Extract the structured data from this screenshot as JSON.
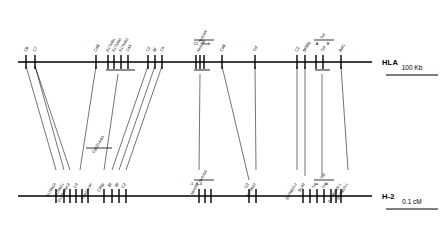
{
  "figure": {
    "type": "comparative-genetic-map"
  },
  "axes": [
    {
      "id": "hla",
      "label": "HLA",
      "y": 62,
      "x_start": 18,
      "x_end": 372,
      "species": "human"
    },
    {
      "id": "h2",
      "label": "H-2",
      "y": 196,
      "x_start": 18,
      "x_end": 372,
      "species": "mouse"
    }
  ],
  "scalebars": [
    {
      "id": "kb",
      "label": "100 Kb",
      "x1": 386,
      "x2": 438,
      "y": 75,
      "text_y": 70
    },
    {
      "id": "cm",
      "label": "0.1 cM",
      "x1": 386,
      "x2": 438,
      "y": 209,
      "text_y": 204
    }
  ],
  "hla_loci": [
    {
      "label": "C6",
      "x": 26
    },
    {
      "label": "C7",
      "x": 35
    },
    {
      "label": "C4B",
      "x": 96
    },
    {
      "label": "D17S451",
      "x": 108
    },
    {
      "label": "D17S450",
      "x": 114
    },
    {
      "label": "D17S452",
      "x": 121
    },
    {
      "label": "C4A",
      "x": 128
    },
    {
      "label": "C2",
      "x": 148
    },
    {
      "label": "Bf",
      "x": 155
    },
    {
      "label": "C4",
      "x": 162
    },
    {
      "label": "Notch4",
      "x": 199
    },
    {
      "label": "C4B",
      "x": 222
    },
    {
      "label": "Tnf",
      "x": 255
    },
    {
      "label": "C2",
      "x": 297
    },
    {
      "label": "Bf/Bfg",
      "x": 305
    },
    {
      "label": "Tnf",
      "x": 323
    },
    {
      "label": "Bat1",
      "x": 341
    }
  ],
  "hla_tick_x": [
    26,
    35,
    96,
    108,
    114,
    121,
    128,
    148,
    155,
    162,
    196,
    200,
    204,
    222,
    255,
    297,
    305,
    316,
    323,
    341
  ],
  "h2_tick_x": [
    56,
    64,
    70,
    76,
    82,
    88,
    104,
    112,
    119,
    126,
    199,
    205,
    211,
    249,
    256,
    303,
    310,
    317,
    324,
    331,
    336,
    341
  ],
  "hla_brackets": [
    {
      "id": "c4-cluster",
      "x1": 106,
      "x2": 135,
      "y": 70,
      "labels": []
    },
    {
      "id": "notch-cluster",
      "x1": 194,
      "x2": 210,
      "y": 70,
      "labels": []
    },
    {
      "id": "tnf-cluster",
      "x1": 315,
      "x2": 330,
      "y": 70,
      "labels": []
    }
  ],
  "hla_top_brackets": [
    {
      "id": "notch4-bracket",
      "x1": 194,
      "x2": 214,
      "y": 40,
      "top_label": "Notch4",
      "sub_labels": [
        {
          "text": "21",
          "x": 196
        },
        {
          "text": "Rxrb",
          "x": 206
        }
      ]
    },
    {
      "id": "tnf-bracket",
      "x1": 314,
      "x2": 334,
      "y": 40,
      "top_label": "Tnf",
      "sub_labels": [
        {
          "text": "A",
          "x": 317
        },
        {
          "text": "B",
          "x": 328
        }
      ]
    }
  ],
  "h2_brackets": [
    {
      "id": "cyp21-bracket",
      "x1": 86,
      "x2": 112,
      "y": 148,
      "top_label": "Cyp21a-ps",
      "sub_labels": []
    },
    {
      "id": "notch-bracket",
      "x1": 194,
      "x2": 214,
      "y": 180,
      "top_label": "Notch4",
      "sub_labels": [
        {
          "text": "-1 -3 -4",
          "x": 196
        }
      ]
    },
    {
      "id": "tnf-b-bracket",
      "x1": 314,
      "x2": 334,
      "y": 180,
      "top_label": "Tnf",
      "sub_labels": [
        {
          "text": "a",
          "x": 317
        },
        {
          "text": "b",
          "x": 327
        }
      ]
    }
  ],
  "h2_loci": [
    {
      "label": "D17Mit16",
      "x": 56
    },
    {
      "label": "D17Mit21",
      "x": 64
    },
    {
      "label": "D17Mit28/C4",
      "x": 70
    },
    {
      "label": "C4",
      "x": 78
    },
    {
      "label": "Cyp21a-ps",
      "x": 92
    },
    {
      "label": "C4bp",
      "x": 104
    },
    {
      "label": "Bf",
      "x": 112
    },
    {
      "label": "Bf",
      "x": 119
    },
    {
      "label": "C2",
      "x": 126
    },
    {
      "label": "Notch4",
      "x": 199
    },
    {
      "label": "C2",
      "x": 249
    },
    {
      "label": "D17Mit22",
      "x": 256
    },
    {
      "label": "D17Mit23-2",
      "x": 297
    },
    {
      "label": "B144",
      "x": 305
    },
    {
      "label": "Tnf",
      "x": 317
    },
    {
      "label": "Tnf",
      "x": 327
    },
    {
      "label": "D17Mit33/E-1",
      "x": 341
    },
    {
      "label": "D17Mit23-1",
      "x": 348
    }
  ],
  "homology_lines": [
    {
      "x1": 26,
      "y1": 66,
      "x2": 56,
      "y2": 170
    },
    {
      "x1": 35,
      "y1": 66,
      "x2": 64,
      "y2": 170
    },
    {
      "x1": 35,
      "y1": 66,
      "x2": 70,
      "y2": 170
    },
    {
      "x1": 96,
      "y1": 66,
      "x2": 80,
      "y2": 170
    },
    {
      "x1": 118,
      "y1": 74,
      "x2": 104,
      "y2": 170
    },
    {
      "x1": 148,
      "y1": 66,
      "x2": 112,
      "y2": 170
    },
    {
      "x1": 155,
      "y1": 66,
      "x2": 119,
      "y2": 170
    },
    {
      "x1": 162,
      "y1": 66,
      "x2": 126,
      "y2": 170
    },
    {
      "x1": 200,
      "y1": 74,
      "x2": 199,
      "y2": 170
    },
    {
      "x1": 222,
      "y1": 66,
      "x2": 249,
      "y2": 180
    },
    {
      "x1": 255,
      "y1": 66,
      "x2": 256,
      "y2": 170
    },
    {
      "x1": 297,
      "y1": 66,
      "x2": 297,
      "y2": 170
    },
    {
      "x1": 305,
      "y1": 66,
      "x2": 305,
      "y2": 176
    },
    {
      "x1": 322,
      "y1": 74,
      "x2": 322,
      "y2": 176
    },
    {
      "x1": 341,
      "y1": 66,
      "x2": 348,
      "y2": 170
    }
  ]
}
